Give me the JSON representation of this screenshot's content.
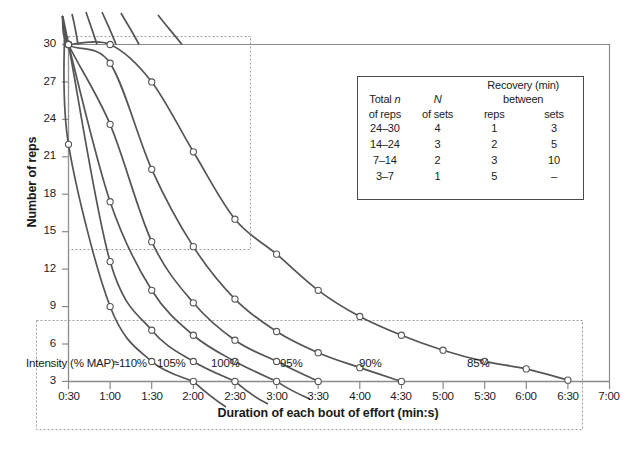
{
  "chart_data": {
    "type": "line",
    "title": "",
    "xlabel": "Duration of each bout of effort (min:s)",
    "ylabel": "Number of reps",
    "xtype": "time",
    "xticks": [
      "0:30",
      "1:00",
      "1:30",
      "2:00",
      "2:30",
      "3:00",
      "3:30",
      "4:00",
      "4:30",
      "5:00",
      "5:30",
      "6:00",
      "6:30",
      "7:00"
    ],
    "xlim": [
      "0:30",
      "7:00"
    ],
    "yticks": [
      3,
      6,
      9,
      12,
      15,
      18,
      21,
      24,
      27,
      30
    ],
    "ylim": [
      3,
      30
    ],
    "grid": false,
    "legend_position": "inside-top-right",
    "marker": "open-circle",
    "x_minutes": [
      0.5,
      1.0,
      1.5,
      2.0,
      2.5,
      3.0,
      3.5,
      4.0,
      4.5,
      5.0,
      5.5,
      6.0,
      6.5,
      7.0
    ],
    "series": [
      {
        "name": "≈110%",
        "label": "≈110%",
        "color": "#555555",
        "x": [
          0.5,
          1.0,
          1.5,
          2.0
        ],
        "values": [
          22.0,
          9.0,
          4.6,
          3.0
        ]
      },
      {
        "name": "105%",
        "label": "105%",
        "color": "#555555",
        "x": [
          0.5,
          1.0,
          1.5,
          2.0,
          2.5
        ],
        "values": [
          30.0,
          12.6,
          7.1,
          4.6,
          3.0
        ]
      },
      {
        "name": "100%",
        "label": "100%",
        "color": "#555555",
        "x": [
          0.5,
          1.0,
          1.5,
          2.0,
          2.5,
          3.0
        ],
        "values": [
          30.0,
          17.4,
          10.3,
          6.7,
          4.6,
          3.0
        ]
      },
      {
        "name": "95%",
        "label": "95%",
        "color": "#555555",
        "x": [
          0.5,
          1.0,
          1.5,
          2.0,
          2.5,
          3.0,
          3.5
        ],
        "values": [
          30.0,
          23.6,
          14.2,
          9.3,
          6.3,
          4.6,
          3.0
        ]
      },
      {
        "name": "90%",
        "label": "90%",
        "color": "#555555",
        "x": [
          0.5,
          1.0,
          1.5,
          2.0,
          2.5,
          3.0,
          3.5,
          4.0,
          4.5
        ],
        "values": [
          30.0,
          28.5,
          20.0,
          13.8,
          9.6,
          7.0,
          5.3,
          4.1,
          3.0
        ]
      },
      {
        "name": "85%",
        "label": "85%",
        "color": "#555555",
        "x": [
          0.5,
          1.0,
          1.5,
          2.0,
          2.5,
          3.0,
          3.5,
          4.0,
          4.5,
          5.0,
          5.5,
          6.0,
          6.5
        ],
        "values": [
          30.0,
          30.0,
          27.0,
          21.4,
          16.0,
          13.2,
          10.3,
          8.2,
          6.7,
          5.5,
          4.6,
          4.0,
          3.1
        ]
      }
    ],
    "intensity_note": "Intensity (% MAP)",
    "annotations": [
      {
        "text": "≈110%",
        "x_px": 113,
        "y_px": 355
      },
      {
        "text": "105%",
        "x_px": 155,
        "y_px": 355
      },
      {
        "text": "100%",
        "x_px": 209,
        "y_px": 355
      },
      {
        "text": "95%",
        "x_px": 277,
        "y_px": 355
      },
      {
        "text": "90%",
        "x_px": 357,
        "y_px": 355
      },
      {
        "text": "85%",
        "x_px": 465,
        "y_px": 355
      }
    ]
  },
  "axes": {
    "y_title": "Number of reps",
    "x_title": "Duration of each bout of effort (min:s)",
    "y_tick_labels": [
      "30",
      "27",
      "24",
      "21",
      "18",
      "15",
      "12",
      "9",
      "6",
      "3"
    ],
    "x_tick_labels": [
      "0:30",
      "1:00",
      "1:30",
      "2:00",
      "2:30",
      "3:00",
      "3:30",
      "4:00",
      "4:30",
      "5:00",
      "5:30",
      "6:00",
      "6:30",
      "7:00"
    ]
  },
  "legend_table": {
    "header_recovery": "Recovery (min)",
    "header_between": "between",
    "columns": [
      {
        "line1": "Total",
        "italic": "n",
        "line2": "of reps"
      },
      {
        "line1": "",
        "italic": "N",
        "line2": "of sets"
      },
      {
        "line1": "",
        "italic": "",
        "line2": "reps"
      },
      {
        "line1": "",
        "italic": "",
        "line2": "sets"
      }
    ],
    "col_headers_top": [
      "Total n",
      "N",
      "",
      ""
    ],
    "col_headers_bottom": [
      "of reps",
      "of sets",
      "reps",
      "sets"
    ],
    "rows": [
      {
        "total_reps": "24–30",
        "sets": "4",
        "rec_reps": "1",
        "rec_sets": "3"
      },
      {
        "total_reps": "14–24",
        "sets": "3",
        "rec_reps": "2",
        "rec_sets": "5"
      },
      {
        "total_reps": "7–14",
        "sets": "2",
        "rec_reps": "3",
        "rec_sets": "10"
      },
      {
        "total_reps": "3–7",
        "sets": "1",
        "rec_reps": "5",
        "rec_sets": "–"
      }
    ]
  },
  "colors": {
    "curve": "#555555",
    "axis": "#8a8a8a",
    "dashed": "#9a9a9a",
    "text": "#1c1c1c",
    "marker_fill": "#ffffff"
  }
}
